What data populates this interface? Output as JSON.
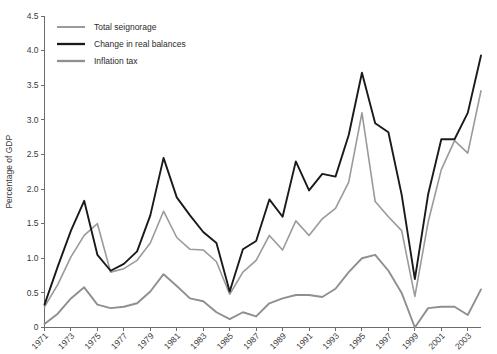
{
  "chart_data": {
    "type": "line",
    "title": "",
    "xlabel": "",
    "ylabel": "Percentage of GDP",
    "ylim": [
      0,
      4.5
    ],
    "ytick_step": 0.5,
    "ytick_labels": [
      "0",
      "0.5",
      "1.0",
      "1.5",
      "2.0",
      "2.5",
      "3.0",
      "3.5",
      "4.0",
      "4.5"
    ],
    "ytick_values": [
      0,
      0.5,
      1.0,
      1.5,
      2.0,
      2.5,
      3.0,
      3.5,
      4.0,
      4.5
    ],
    "xlim": [
      1971,
      2004
    ],
    "xtick_labels": [
      "1971",
      "1973",
      "1975",
      "1977",
      "1979",
      "1981",
      "1983",
      "1985",
      "1987",
      "1989",
      "1991",
      "1993",
      "1995",
      "1997",
      "1999",
      "2001",
      "2003"
    ],
    "xtick_values": [
      1971,
      1973,
      1975,
      1977,
      1979,
      1981,
      1983,
      1985,
      1987,
      1989,
      1991,
      1993,
      1995,
      1997,
      1999,
      2001,
      2003
    ],
    "x": [
      1971,
      1972,
      1973,
      1974,
      1975,
      1976,
      1977,
      1978,
      1979,
      1980,
      1981,
      1982,
      1983,
      1984,
      1985,
      1986,
      1987,
      1988,
      1989,
      1990,
      1991,
      1992,
      1993,
      1994,
      1995,
      1996,
      1997,
      1998,
      1999,
      2000,
      2001,
      2002,
      2003,
      2004
    ],
    "grid": false,
    "legend_position": "top-left",
    "series": [
      {
        "name": "Total seignorage",
        "color": "#9a9a9a",
        "width": 1.6,
        "values": [
          0.3,
          0.62,
          1.02,
          1.33,
          1.5,
          0.8,
          0.85,
          0.97,
          1.22,
          1.68,
          1.3,
          1.13,
          1.12,
          0.95,
          0.48,
          0.8,
          0.97,
          1.33,
          1.12,
          1.54,
          1.33,
          1.57,
          1.72,
          2.1,
          3.1,
          1.82,
          1.6,
          1.4,
          0.45,
          1.52,
          2.28,
          2.7,
          2.52,
          3.42
        ]
      },
      {
        "name": "Change in real balances",
        "color": "#1a1a1a",
        "width": 1.9,
        "values": [
          0.33,
          0.88,
          1.4,
          1.83,
          1.05,
          0.82,
          0.92,
          1.1,
          1.62,
          2.45,
          1.88,
          1.62,
          1.38,
          1.22,
          0.52,
          1.13,
          1.25,
          1.85,
          1.6,
          2.4,
          1.98,
          2.22,
          2.18,
          2.78,
          3.68,
          2.95,
          2.82,
          1.92,
          0.7,
          1.92,
          2.72,
          2.72,
          3.1,
          3.93
        ]
      },
      {
        "name": "Inflation tax",
        "color": "#8f8f8f",
        "width": 1.9,
        "values": [
          0.05,
          0.2,
          0.42,
          0.58,
          0.33,
          0.28,
          0.3,
          0.35,
          0.52,
          0.77,
          0.6,
          0.42,
          0.38,
          0.22,
          0.12,
          0.22,
          0.16,
          0.35,
          0.42,
          0.47,
          0.47,
          0.44,
          0.56,
          0.8,
          1.0,
          1.05,
          0.82,
          0.5,
          0.0,
          0.28,
          0.3,
          0.3,
          0.18,
          0.55
        ]
      }
    ]
  },
  "legend": {
    "items": [
      {
        "label": "Total seignorage"
      },
      {
        "label": "Change in real balances"
      },
      {
        "label": "Inflation tax"
      }
    ]
  },
  "axes": {
    "y_title": "Percentage of GDP"
  }
}
